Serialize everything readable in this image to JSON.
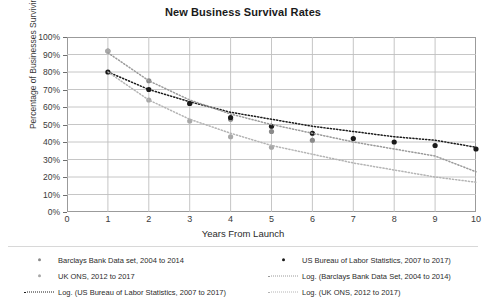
{
  "chart_data": {
    "type": "line",
    "title": "New Business Survival Rates",
    "xlabel": "Years From Launch",
    "ylabel": "Percentage of Businesses Surviving",
    "xlim": [
      0,
      10
    ],
    "ylim": [
      0,
      100
    ],
    "grid": true,
    "legend_position": "bottom",
    "xticks": [
      "0",
      "1",
      "2",
      "3",
      "4",
      "5",
      "6",
      "7",
      "8",
      "9",
      "10"
    ],
    "yticks": [
      "0%",
      "10%",
      "20%",
      "30%",
      "40%",
      "50%",
      "60%",
      "70%",
      "80%",
      "90%",
      "100%"
    ],
    "series": [
      {
        "name": "Barclays Bank Data set, 2004 to 2014",
        "style": "markers",
        "marker": "circle",
        "color": "#8a8a8a",
        "x": [
          1,
          2,
          3,
          4,
          5,
          6
        ],
        "y": [
          92,
          75,
          62,
          53,
          46,
          41
        ]
      },
      {
        "name": "US Bureau of Labor Statistics, 2007 to 2017)",
        "style": "markers",
        "marker": "circle",
        "color": "#1a1a1a",
        "x": [
          1,
          2,
          3,
          4,
          5,
          6,
          7,
          8,
          9,
          10
        ],
        "y": [
          80,
          70,
          62,
          54,
          49,
          45,
          42,
          40,
          38,
          36
        ]
      },
      {
        "name": "UK ONS, 2012 to 2017",
        "style": "markers",
        "marker": "circle",
        "color": "#a8a8a8",
        "x": [
          1,
          2,
          3,
          4,
          5
        ],
        "y": [
          92,
          64,
          52,
          43,
          37
        ]
      },
      {
        "name": "Log. (US Bureau of Labor Statistics, 2007 to 2017)",
        "style": "dotted-trend",
        "color": "#1a1a1a",
        "x": [
          1,
          2,
          3,
          4,
          5,
          6,
          7,
          8,
          9,
          10
        ],
        "y": [
          80,
          70,
          63,
          57,
          53,
          49,
          46,
          43,
          41,
          37
        ]
      },
      {
        "name": "Log. (Barclays Bank Data Set, 2004 to 2014)",
        "style": "dotted-trend",
        "color": "#9a9a9a",
        "x": [
          1,
          2,
          3,
          4,
          5,
          6,
          7,
          8,
          9,
          10
        ],
        "y": [
          91,
          75,
          64,
          56,
          50,
          45,
          40,
          36,
          32,
          23
        ]
      },
      {
        "name": "Log. (UK ONS, 2012 to 2017)",
        "style": "dotted-trend",
        "color": "#b4b4b4",
        "x": [
          1,
          2,
          3,
          4,
          5,
          6,
          7,
          8,
          9,
          10
        ],
        "y": [
          80,
          64,
          53,
          45,
          38,
          33,
          28,
          24,
          20,
          17
        ]
      }
    ]
  },
  "legend": {
    "left": [
      {
        "label": "Barclays Bank Data set, 2004 to 2014",
        "key": "marker",
        "color": "#8a8a8a"
      },
      {
        "label": "UK ONS, 2012 to 2017",
        "key": "marker",
        "color": "#a8a8a8"
      },
      {
        "label": "Log. (US Bureau of Labor Statistics, 2007 to 2017)",
        "key": "dotted",
        "color": "#1a1a1a"
      }
    ],
    "right": [
      {
        "label": "US Bureau of Labor Statistics, 2007 to 2017)",
        "key": "marker",
        "color": "#1a1a1a"
      },
      {
        "label": "Log. (Barclays Bank Data Set, 2004 to 2014)",
        "key": "dotted",
        "color": "#9a9a9a"
      },
      {
        "label": "Log. (UK ONS, 2012 to 2017)",
        "key": "dotted",
        "color": "#b4b4b4"
      }
    ]
  },
  "colors": {
    "frame": "#9b9b9b",
    "grid": "#bfbfbf",
    "text": "#2b2b2b",
    "background": "#ffffff"
  }
}
